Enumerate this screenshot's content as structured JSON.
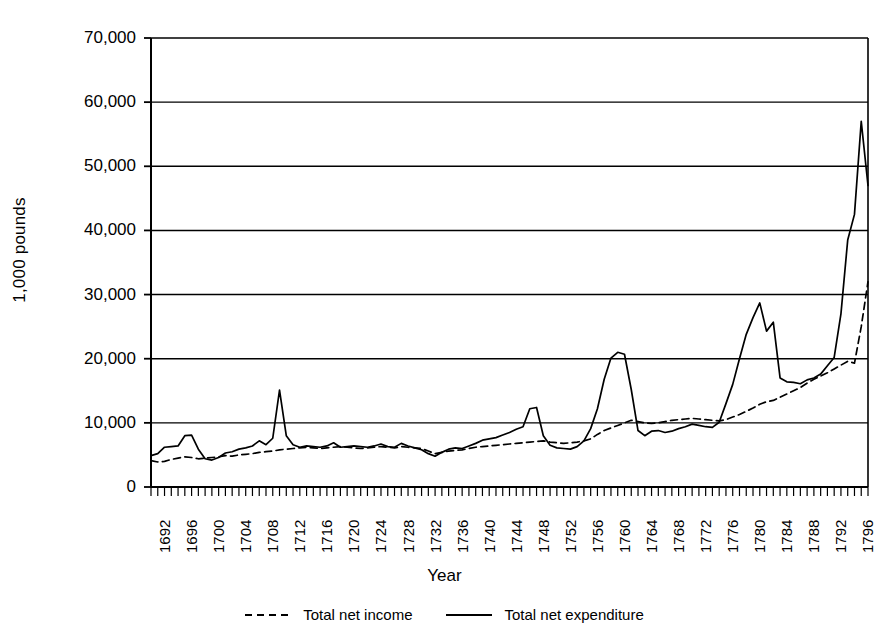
{
  "chart_data": {
    "type": "line",
    "title": "",
    "xlabel": "Year",
    "ylabel": "1,000 pounds",
    "ylim": [
      0,
      70000
    ],
    "xlim": [
      1692,
      1798
    ],
    "grid": true,
    "legend_position": "bottom",
    "y_ticks": [
      "0",
      "10,000",
      "20,000",
      "30,000",
      "40,000",
      "50,000",
      "60,000",
      "70,000"
    ],
    "y_tick_values": [
      0,
      10000,
      20000,
      30000,
      40000,
      50000,
      60000,
      70000
    ],
    "x_tick_labels": [
      "1692",
      "1696",
      "1700",
      "1704",
      "1708",
      "1712",
      "1716",
      "1720",
      "1724",
      "1728",
      "1732",
      "1736",
      "1740",
      "1744",
      "1748",
      "1752",
      "1756",
      "1760",
      "1764",
      "1768",
      "1772",
      "1776",
      "1780",
      "1784",
      "1788",
      "1792",
      "1796"
    ],
    "x_tick_values": [
      1692,
      1696,
      1700,
      1704,
      1708,
      1712,
      1716,
      1720,
      1724,
      1728,
      1732,
      1736,
      1740,
      1744,
      1748,
      1752,
      1756,
      1760,
      1764,
      1768,
      1772,
      1776,
      1780,
      1784,
      1788,
      1792,
      1796
    ],
    "x": [
      1692,
      1693,
      1694,
      1695,
      1696,
      1697,
      1698,
      1699,
      1700,
      1701,
      1702,
      1703,
      1704,
      1705,
      1706,
      1707,
      1708,
      1709,
      1710,
      1711,
      1712,
      1713,
      1714,
      1715,
      1716,
      1717,
      1718,
      1719,
      1720,
      1721,
      1722,
      1723,
      1724,
      1725,
      1726,
      1727,
      1728,
      1729,
      1730,
      1731,
      1732,
      1733,
      1734,
      1735,
      1736,
      1737,
      1738,
      1739,
      1740,
      1741,
      1742,
      1743,
      1744,
      1745,
      1746,
      1747,
      1748,
      1749,
      1750,
      1751,
      1752,
      1753,
      1754,
      1755,
      1756,
      1757,
      1758,
      1759,
      1760,
      1761,
      1762,
      1763,
      1764,
      1765,
      1766,
      1767,
      1768,
      1769,
      1770,
      1771,
      1772,
      1773,
      1774,
      1775,
      1776,
      1777,
      1778,
      1779,
      1780,
      1781,
      1782,
      1783,
      1784,
      1785,
      1786,
      1787,
      1788,
      1789,
      1790,
      1791,
      1792,
      1793,
      1794,
      1795,
      1796,
      1797,
      1798
    ],
    "series": [
      {
        "name": "Total net income",
        "style": "dashed",
        "color": "#000000",
        "values": [
          4100,
          3900,
          4000,
          4300,
          4500,
          4700,
          4600,
          4400,
          4500,
          4600,
          4700,
          4900,
          4800,
          5000,
          5100,
          5200,
          5400,
          5500,
          5600,
          5800,
          5900,
          6000,
          6100,
          6200,
          6100,
          6000,
          6100,
          6200,
          6300,
          6200,
          6100,
          6000,
          6100,
          6200,
          6300,
          6200,
          6100,
          6300,
          6200,
          6100,
          6000,
          5600,
          5200,
          5400,
          5600,
          5700,
          5800,
          6000,
          6200,
          6300,
          6400,
          6500,
          6600,
          6700,
          6800,
          6900,
          7000,
          7100,
          7200,
          7000,
          6900,
          6800,
          6900,
          7000,
          7200,
          7500,
          8200,
          8800,
          9200,
          9600,
          10000,
          10400,
          10200,
          10000,
          9900,
          10000,
          10200,
          10400,
          10500,
          10600,
          10700,
          10600,
          10500,
          10400,
          10300,
          10500,
          10900,
          11300,
          11800,
          12300,
          12900,
          13300,
          13500,
          14000,
          14500,
          15000,
          15500,
          16200,
          16800,
          17300,
          17800,
          18400,
          19000,
          19600,
          19300,
          25000,
          32000
        ]
      },
      {
        "name": "Total net expenditure",
        "style": "solid",
        "color": "#000000",
        "values": [
          4900,
          5200,
          6200,
          6300,
          6400,
          8000,
          8100,
          5900,
          4400,
          4200,
          4600,
          5300,
          5500,
          5900,
          6100,
          6400,
          7200,
          6600,
          7600,
          15100,
          8000,
          6600,
          6200,
          6400,
          6300,
          6200,
          6400,
          6900,
          6200,
          6300,
          6400,
          6300,
          6200,
          6400,
          6700,
          6300,
          6200,
          6800,
          6400,
          6100,
          5800,
          5200,
          4800,
          5400,
          5900,
          6100,
          6000,
          6400,
          6800,
          7300,
          7500,
          7700,
          8100,
          8500,
          9000,
          9400,
          12200,
          12400,
          8000,
          6500,
          6100,
          6000,
          5900,
          6300,
          7200,
          9100,
          12200,
          16800,
          20100,
          21000,
          20700,
          15200,
          8800,
          8000,
          8700,
          8800,
          8500,
          8700,
          9100,
          9400,
          9800,
          9600,
          9400,
          9300,
          10100,
          13000,
          16000,
          20000,
          23800,
          26400,
          28700,
          24300,
          25700,
          17000,
          16400,
          16300,
          16100,
          16700,
          17000,
          17600,
          18900,
          20200,
          27000,
          38500,
          42500,
          57000,
          47000
        ]
      }
    ],
    "annotations": []
  },
  "legend": {
    "items": [
      {
        "label": "Total net income",
        "style": "dashed"
      },
      {
        "label": "Total net expenditure",
        "style": "solid"
      }
    ]
  },
  "axes": {
    "x_title": "Year",
    "y_title": "1,000 pounds"
  },
  "colors": {
    "line": "#000000",
    "grid": "#000000",
    "background": "#ffffff"
  }
}
